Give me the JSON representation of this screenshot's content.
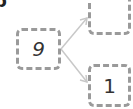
{
  "diagram": {
    "corner_label": "b",
    "source_box": {
      "value": "9"
    },
    "target_boxes": [
      {
        "value": ""
      },
      {
        "value": "1"
      }
    ],
    "colors": {
      "box_border": "#9a9a9a",
      "arrow": "#c8c8c8",
      "text": "#333333"
    }
  }
}
